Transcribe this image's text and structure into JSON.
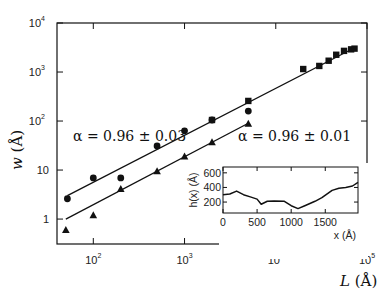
{
  "chart_data": [
    {
      "type": "scatter",
      "title": "",
      "xlabel": "L (Å)",
      "ylabel": "w (Å)",
      "xscale": "log",
      "yscale": "log",
      "xlim": [
        40,
        100000
      ],
      "ylim": [
        0.31,
        10000
      ],
      "x_ticks": [
        {
          "label": "10",
          "exp": "2",
          "value": 100
        },
        {
          "label": "10",
          "exp": "3",
          "value": 1000
        },
        {
          "label": "10",
          "exp": "4",
          "value": 10000
        },
        {
          "label": "10",
          "exp": "5",
          "value": 100000
        }
      ],
      "y_ticks": [
        {
          "label": "1",
          "exp": "",
          "value": 1
        },
        {
          "label": "10",
          "exp": "",
          "value": 10
        },
        {
          "label": "10",
          "exp": "2",
          "value": 100
        },
        {
          "label": "10",
          "exp": "3",
          "value": 1000
        },
        {
          "label": "10",
          "exp": "4",
          "value": 10000
        }
      ],
      "grid": false,
      "series": [
        {
          "name": "circles",
          "marker": "circle",
          "points": [
            [
              52,
              2.6
            ],
            [
              100,
              6.9
            ],
            [
              200,
              6.9
            ],
            [
              500,
              31
            ],
            [
              1000,
              63
            ],
            [
              2000,
              105
            ],
            [
              5000,
              160
            ]
          ]
        },
        {
          "name": "triangles",
          "marker": "triangle",
          "points": [
            [
              50,
              0.6
            ],
            [
              100,
              1.2
            ],
            [
              200,
              4.1
            ],
            [
              500,
              9.5
            ],
            [
              1000,
              19
            ],
            [
              2000,
              37
            ],
            [
              5000,
              88
            ]
          ]
        },
        {
          "name": "squares",
          "marker": "square",
          "points": [
            [
              2000,
              105
            ],
            [
              5000,
              257
            ],
            [
              20000,
              1150
            ],
            [
              30000,
              1330
            ],
            [
              38000,
              1700
            ],
            [
              46000,
              2250
            ],
            [
              56000,
              2700
            ],
            [
              67000,
              2900
            ],
            [
              73000,
              3000
            ]
          ]
        }
      ],
      "fits": [
        {
          "name": "upper fit",
          "from": [
            52,
            3.0
          ],
          "to": [
            75000,
            3200
          ],
          "label": "α = 0.96 ± 0.03"
        },
        {
          "name": "lower fit",
          "from": [
            50,
            1.0
          ],
          "to": [
            5000,
            90
          ],
          "label": "α = 0.96 ± 0.01"
        }
      ],
      "annotations": [
        "α = 0.96 ± 0.03",
        "α = 0.96 ± 0.01"
      ]
    },
    {
      "type": "line",
      "title": "inset",
      "xlabel": "x (Å)",
      "ylabel": "h(x) (Å)",
      "xlim": [
        0,
        1980
      ],
      "ylim": [
        50,
        680
      ],
      "x_ticks": [
        "0",
        "500",
        "1000",
        "1500"
      ],
      "y_ticks": [
        "200",
        "400",
        "600"
      ],
      "x": [
        0,
        100,
        200,
        300,
        400,
        500,
        560,
        650,
        750,
        900,
        1000,
        1100,
        1200,
        1350,
        1450,
        1600,
        1700,
        1800,
        1900,
        1980
      ],
      "values": [
        300,
        310,
        350,
        300,
        270,
        240,
        170,
        210,
        215,
        210,
        150,
        110,
        150,
        210,
        260,
        360,
        390,
        400,
        420,
        470
      ]
    }
  ],
  "labels": {
    "xlabel_var": "L",
    "xlabel_unit": "(Å)",
    "ylabel_var": "w",
    "ylabel_unit": "(Å)",
    "fit_upper": "α = 0.96 ± 0.03",
    "fit_lower": "α = 0.96 ± 0.01",
    "inset_xlabel": "x (Å)",
    "inset_ylabel": "h(x) (Å)"
  },
  "colors": {
    "ink": "#111111",
    "background": "#ffffff"
  }
}
